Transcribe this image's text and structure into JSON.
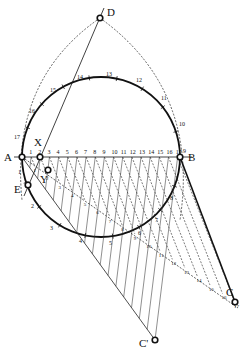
{
  "diagram": {
    "title": "",
    "points": [
      {
        "id": "D",
        "label": "D",
        "x": 100,
        "y": 18,
        "lx": 107,
        "ly": 16
      },
      {
        "id": "A",
        "label": "A",
        "x": 22,
        "y": 157,
        "lx": 4,
        "ly": 161
      },
      {
        "id": "B",
        "label": "B",
        "x": 180,
        "y": 157,
        "lx": 188,
        "ly": 161
      },
      {
        "id": "X",
        "label": "X",
        "x": 40,
        "y": 157,
        "lx": 34,
        "ly": 146
      },
      {
        "id": "Y",
        "label": "Y",
        "x": 48,
        "y": 170,
        "lx": 40,
        "ly": 183
      },
      {
        "id": "E",
        "label": "E",
        "x": 28,
        "y": 185,
        "lx": 14,
        "ly": 193
      },
      {
        "id": "C",
        "label": "C",
        "x": 235,
        "y": 302,
        "lx": 226,
        "ly": 296
      },
      {
        "id": "Cprime",
        "label": "C'",
        "x": 155,
        "y": 340,
        "lx": 139,
        "ly": 347
      }
    ],
    "ab_labels": [
      "1",
      "2",
      "3",
      "4",
      "5",
      "6",
      "7",
      "8",
      "9",
      "10",
      "11",
      "12",
      "13",
      "14",
      "15",
      "16",
      "17"
    ],
    "circle_labels": [
      {
        "t": "9",
        "x": 183,
        "y": 153
      },
      {
        "t": "10",
        "x": 179,
        "y": 126
      },
      {
        "t": "11",
        "x": 161,
        "y": 100
      },
      {
        "t": "12",
        "x": 136,
        "y": 82
      },
      {
        "t": "13",
        "x": 106,
        "y": 76
      },
      {
        "t": "14",
        "x": 77,
        "y": 79
      },
      {
        "t": "15",
        "x": 50,
        "y": 92
      },
      {
        "t": "16",
        "x": 29,
        "y": 113
      },
      {
        "t": "17",
        "x": 14,
        "y": 139
      },
      {
        "t": "1",
        "x": 18,
        "y": 174
      },
      {
        "t": "2",
        "x": 31,
        "y": 208
      },
      {
        "t": "3",
        "x": 50,
        "y": 230
      },
      {
        "t": "4",
        "x": 79,
        "y": 243
      },
      {
        "t": "5",
        "x": 109,
        "y": 245
      },
      {
        "t": "6",
        "x": 138,
        "y": 235
      },
      {
        "t": "7",
        "x": 155,
        "y": 222
      },
      {
        "t": "8",
        "x": 170,
        "y": 200
      }
    ],
    "diag_labels": [
      "1",
      "2",
      "3",
      "4",
      "5",
      "6",
      "7",
      "8",
      "9",
      "10",
      "11",
      "12",
      "13",
      "14",
      "15",
      "16",
      "17"
    ],
    "colors": {
      "ink": "#111111",
      "background": "#ffffff"
    }
  }
}
